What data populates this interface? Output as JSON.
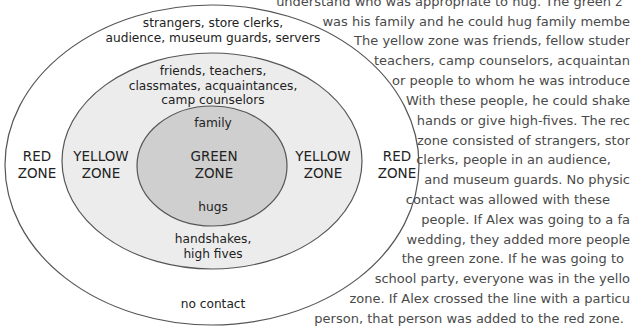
{
  "colors": {
    "outer_fill": "#ffffff",
    "middle_fill": "#ececec",
    "inner_fill": "#cfcfcf",
    "stroke": "#555555",
    "label_text": "#222222",
    "paragraph_text": "#4a4a4a"
  },
  "diagram": {
    "red_zone": {
      "left_label": [
        "RED",
        "ZONE"
      ],
      "right_label": [
        "RED",
        "ZONE"
      ],
      "people": [
        "strangers, store clerks,",
        "audience, museum guards, servers"
      ],
      "contact": "no contact"
    },
    "yellow_zone": {
      "left_label": [
        "YELLOW",
        "ZONE"
      ],
      "right_label": [
        "YELLOW",
        "ZONE"
      ],
      "people": [
        "friends, teachers,",
        "classmates, acquaintances,",
        "camp counselors"
      ],
      "contact": [
        "handshakes,",
        "high fives"
      ]
    },
    "green_zone": {
      "label": [
        "GREEN",
        "ZONE"
      ],
      "people": "family",
      "contact": "hugs"
    }
  },
  "paragraph": {
    "lines": [
      "understand who was appropriate to hug.  The green z",
      "was his family and he could hug family membe",
      "The yellow zone was friends, fellow studer",
      "teachers, camp counselors, acquaintan",
      "or people to whom he was introduce",
      "With these people, he could shake",
      "hands or give high-fives.  The rec",
      "zone consisted of strangers, stor",
      "clerks, people in an audience,",
      "and museum guards.  No physic",
      "contact was allowed with these",
      "people.  If Alex was going to a fa",
      "wedding, they added more people",
      "the green zone.  If he was going to",
      "school party, everyone was in the yello",
      "zone.  If Alex crossed the line with a particu",
      "person, that person was added to the red zone."
    ]
  }
}
